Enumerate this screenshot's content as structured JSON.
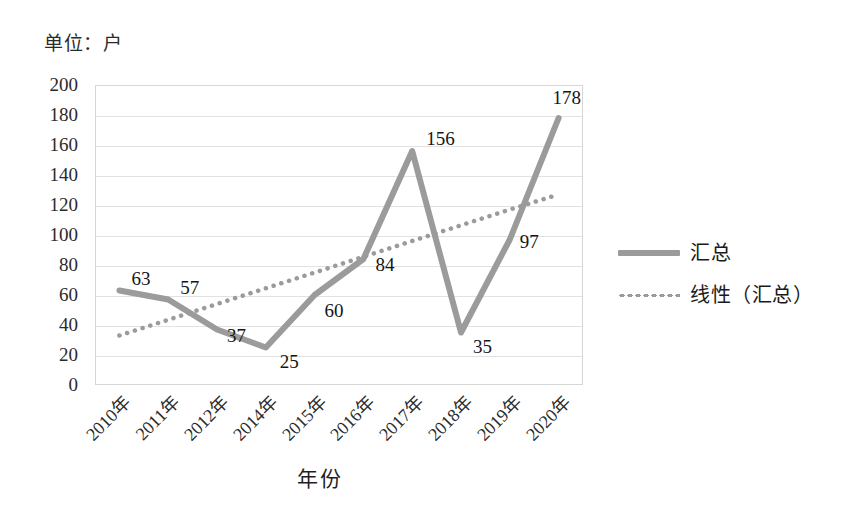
{
  "chart_data": {
    "type": "line",
    "title": "",
    "unit_caption": "单位：户",
    "xlabel": "年份",
    "ylabel": "",
    "categories": [
      "2010年",
      "2011年",
      "2012年",
      "2014年",
      "2015年",
      "2016年",
      "2017年",
      "2018年",
      "2019年",
      "2020年"
    ],
    "series": [
      {
        "name": "汇总",
        "style": "solid",
        "color": "#9b9b9b",
        "values": [
          63,
          57,
          37,
          25,
          60,
          84,
          156,
          35,
          97,
          178
        ],
        "labels": [
          "63",
          "57",
          "37",
          "25",
          "60",
          "84",
          "156",
          "35",
          "97",
          "178"
        ]
      },
      {
        "name": "线性（汇总）",
        "style": "dotted",
        "color": "#9b9b9b",
        "values": [
          33,
          43.5,
          54,
          64.5,
          75,
          85.5,
          96,
          106.5,
          117,
          127
        ]
      }
    ],
    "ylim": [
      0,
      200
    ],
    "yticks": [
      200,
      180,
      160,
      140,
      120,
      100,
      80,
      60,
      40,
      20,
      0
    ],
    "ytick_labels": [
      "200",
      "180",
      "160",
      "140",
      "120",
      "100",
      "80",
      "60",
      "40",
      "20",
      "0"
    ],
    "grid": true,
    "grid_axis": "y",
    "legend_position": "right",
    "legend": [
      {
        "label": "汇总",
        "style": "solid",
        "swatch": "solid-line-swatch"
      },
      {
        "label": "线性（汇总）",
        "style": "dotted",
        "swatch": "dotted-line-swatch"
      }
    ]
  }
}
